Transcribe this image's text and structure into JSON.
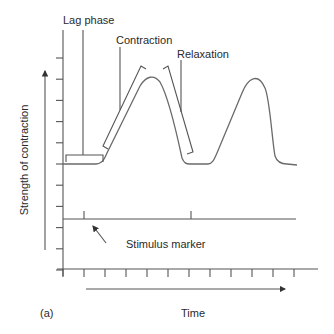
{
  "figure": {
    "panel_label": "(a)",
    "y_axis_label": "Strength of contraction",
    "x_axis_label": "Time",
    "annotations": {
      "lag_phase": "Lag phase",
      "contraction": "Contraction",
      "relaxation": "Relaxation",
      "stimulus_marker": "Stimulus marker"
    },
    "y_tick_count": 11,
    "x_tick_count": 12,
    "stimulus_marks": 2,
    "twitches": 2
  }
}
